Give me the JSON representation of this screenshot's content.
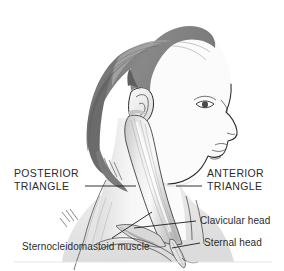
{
  "figure": {
    "background_color": "#ffffff",
    "ink_color": "#2a2a2a"
  },
  "labels": {
    "posterior_triangle": {
      "line1": "POSTERIOR",
      "line2": "TRIANGLE",
      "style": "uppercase",
      "side": "left"
    },
    "anterior_triangle": {
      "line1": "ANTERIOR",
      "line2": "TRIANGLE",
      "style": "uppercase",
      "side": "right"
    },
    "clavicular_head": {
      "text": "Clavicular head",
      "style": "sentence",
      "side": "right"
    },
    "sternal_head": {
      "text": "Sternal head",
      "style": "sentence",
      "side": "right"
    },
    "sternocleidomastoid": {
      "text": "Sternocleidomastoid muscle",
      "style": "sentence",
      "side": "left"
    }
  },
  "anatomy": {
    "parts": [
      {
        "name": "hair",
        "tone": "#8d8d8d"
      },
      {
        "name": "ear",
        "tone": "#f2f2f2"
      },
      {
        "name": "face-profile",
        "tone": "#fbfbfb"
      },
      {
        "name": "neck",
        "tone": "#fbfbfb"
      },
      {
        "name": "sternocleidomastoid-muscle",
        "tone": "#d8d8d8"
      },
      {
        "name": "clavicle",
        "tone": "#ededed"
      },
      {
        "name": "trapezius-border",
        "tone": "#e6e6e6"
      }
    ]
  },
  "footer": {
    "rule_color": "#e4e4e4"
  }
}
